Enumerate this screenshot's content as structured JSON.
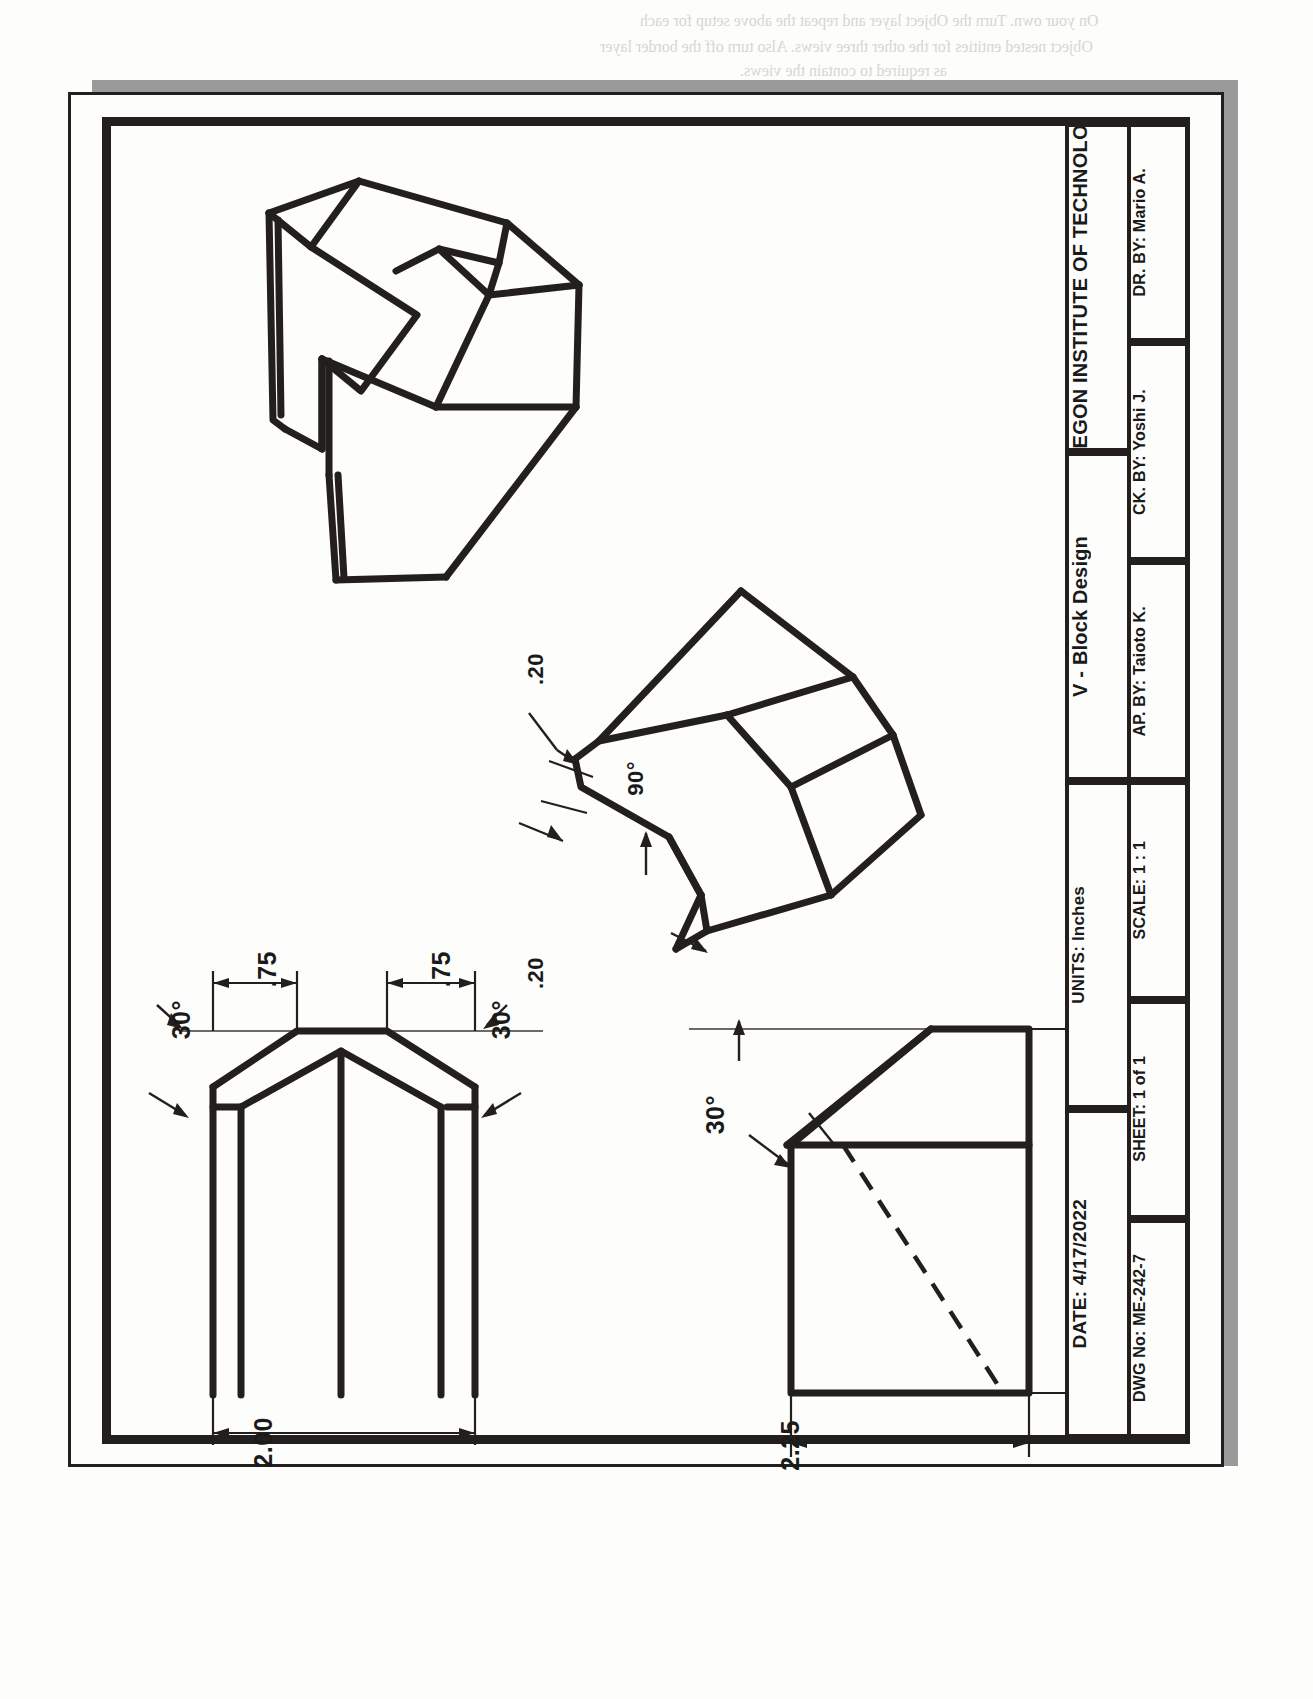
{
  "document": {
    "type": "engineering-drawing",
    "orientation": "rotated-90-ccw",
    "sheet_background": "#fdfdfb",
    "line_color": "#231f1e"
  },
  "title_block": {
    "company": "OREGON INSTITUTE OF TECHNOLOGY",
    "drawing_title": "V - Block Design",
    "units": "UNITS: Inches",
    "date": "DATE: 4/17/2022",
    "drawn_by": "DR. BY: Mario A.",
    "checked_by": "CK. BY: Yoshi J.",
    "approved_by": "AP. BY: Taioto K.",
    "scale": "SCALE: 1 : 1",
    "sheet": "SHEET:  1 of 1",
    "dwg_no": "DWG No: ME-242-7"
  },
  "views": {
    "isometric": {
      "name": "Isometric View"
    },
    "pictorial": {
      "name": "Pictorial Detail View"
    },
    "top": {
      "name": "Top View"
    },
    "right": {
      "name": "Right Side View"
    }
  },
  "dimensions": {
    "top_left_angle": "30°",
    "top_right_angle": "30°",
    "top_left_width": ".75",
    "top_right_width": ".75",
    "overall_width": "2.00",
    "side_angle": "30°",
    "height": "3.00",
    "depth": "2.25",
    "chamfer_a": ".20",
    "chamfer_b": ".20",
    "vee_angle": "90°"
  },
  "bleed_text": {
    "line1": "On your own. Turn the Object layer and repeat the above setup for each",
    "line2": "Object nested entities for the other three views. Also turn off the border layer",
    "line3": "as required to contain the views.",
    "line4": "Creating a 2D Drawing",
    "line5": "Your next step is to create the drawing views. Switch to the Layout1 tab",
    "line6": "and rename it to Drawing. The default viewport arrangement should be deleted.",
    "line7": "1.  Confirm that New Layer overrides and the annotative scaling is",
    "line8": "2.  Place your new layout is set to the",
    "line9": "by setting the following:",
    "line10": "Ribbon Tool: SETbar Group",
    "line11": "command: AD -> Drawing -> Section",
    "line12": "the Viewport Scale List option."
  }
}
